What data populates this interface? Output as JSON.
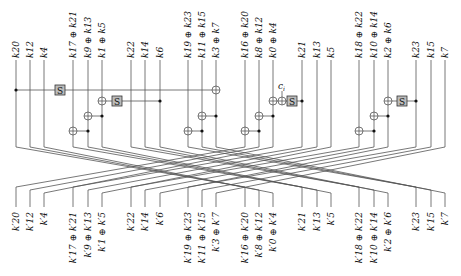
{
  "diagram": {
    "type": "key-schedule-permutation",
    "colors": {
      "line": "#555555",
      "sbox_fill": "#bbbbbb",
      "text": "#111111"
    },
    "wire_x": [
      16,
      30,
      44,
      73,
      88,
      102,
      131,
      145,
      160,
      188,
      202,
      216,
      245,
      259,
      273,
      302,
      317,
      331,
      359,
      374,
      388,
      416,
      431,
      445
    ],
    "top_labels": [
      [
        "k",
        "20"
      ],
      [
        "k",
        "12"
      ],
      [
        "k",
        "4"
      ],
      [
        "k",
        "17 ⊕ k",
        "21"
      ],
      [
        "k",
        "9 ⊕ k",
        "13"
      ],
      [
        "k",
        "1 ⊕ k",
        "5"
      ],
      [
        "k",
        "22"
      ],
      [
        "k",
        "14"
      ],
      [
        "k",
        "6"
      ],
      [
        "k",
        "19 ⊕ k",
        "23"
      ],
      [
        "k",
        "11 ⊕ k",
        "15"
      ],
      [
        "k",
        "3 ⊕ k",
        "7"
      ],
      [
        "k",
        "16 ⊕ k",
        "20"
      ],
      [
        "k",
        "8 ⊕ k",
        "12"
      ],
      [
        "k",
        "0 ⊕ k",
        "4"
      ],
      [
        "k",
        "21"
      ],
      [
        "k",
        "13"
      ],
      [
        "k",
        "5"
      ],
      [
        "k",
        "18 ⊕ k",
        "22"
      ],
      [
        "k",
        "10 ⊕ k",
        "14"
      ],
      [
        "k",
        "2 ⊕ k",
        "6"
      ],
      [
        "k",
        "23"
      ],
      [
        "k",
        "15"
      ],
      [
        "k",
        "7"
      ]
    ],
    "bottom_labels": [
      "k′20",
      "k′12",
      "k′4",
      "k′17 ⊕ k′21",
      "k′9 ⊕ k′13",
      "k′1 ⊕ k′5",
      "k′22",
      "k′14",
      "k′6",
      "k′19 ⊕ k′23",
      "k′11 ⊕ k′15",
      "k′3 ⊕ k′7",
      "k′16 ⊕ k′20",
      "k′8 ⊕ k′12",
      "k′0 ⊕ k′4",
      "k′21",
      "k′13",
      "k′5",
      "k′18 ⊕ k′22",
      "k′10 ⊕ k′14",
      "k′2 ⊕ k′6",
      "k′23",
      "k′15",
      "k′7"
    ],
    "sbox_label": "S",
    "constant_label": "c",
    "constant_sub": "i"
  }
}
